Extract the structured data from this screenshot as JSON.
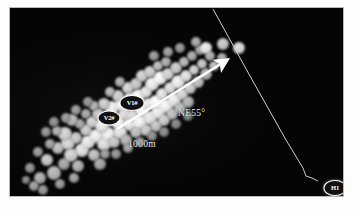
{
  "figure": {
    "type": "map-scatter",
    "background_color": "#070707",
    "frame_color": "#b9b9b9",
    "panel": {
      "x": 9,
      "y": 7,
      "width": 335,
      "height": 190
    }
  },
  "annotations": {
    "bearing_label": "NE55°",
    "scale_label": "1000m"
  },
  "markers": [
    {
      "id": "v1",
      "label": "V1#",
      "x": 122,
      "y": 95
    },
    {
      "id": "v2",
      "label": "V2#",
      "x": 99,
      "y": 110
    },
    {
      "id": "h1",
      "label": "H1",
      "x": 325,
      "y": 180
    }
  ],
  "arrow": {
    "name": "bearing-arrow",
    "color": "#ffffff",
    "x1": 117,
    "y1": 129,
    "x2": 227,
    "y2": 60
  },
  "trace_line": {
    "name": "fault-trace-line",
    "color": "#cfcfcf",
    "points": "213,9 250,76 286,140 303,168 306,176 312,178 318,181"
  },
  "chart_data": {
    "type": "scatter",
    "title": "",
    "xlabel": "",
    "ylabel": "",
    "xlim": [
      0,
      335
    ],
    "ylim": [
      0,
      190
    ],
    "grid": false,
    "legend": "none",
    "series": [
      {
        "name": "event-cluster",
        "color_range": [
          "#4a4a4a",
          "#e8e8e8"
        ],
        "points": [
          [
            44,
            165,
            7,
            0.62
          ],
          [
            37,
            152,
            6,
            0.7
          ],
          [
            54,
            156,
            6,
            0.55
          ],
          [
            30,
            170,
            6,
            0.58
          ],
          [
            61,
            147,
            7,
            0.74
          ],
          [
            48,
            140,
            6,
            0.66
          ],
          [
            40,
            136,
            5,
            0.52
          ],
          [
            58,
            135,
            7,
            0.78
          ],
          [
            68,
            158,
            6,
            0.6
          ],
          [
            72,
            142,
            7,
            0.82
          ],
          [
            66,
            130,
            6,
            0.7
          ],
          [
            55,
            126,
            7,
            0.76
          ],
          [
            47,
            123,
            5,
            0.58
          ],
          [
            78,
            134,
            7,
            0.85
          ],
          [
            84,
            147,
            6,
            0.66
          ],
          [
            90,
            156,
            6,
            0.54
          ],
          [
            76,
            122,
            6,
            0.72
          ],
          [
            86,
            128,
            7,
            0.88
          ],
          [
            94,
            136,
            7,
            0.8
          ],
          [
            82,
            114,
            6,
            0.74
          ],
          [
            70,
            116,
            5,
            0.56
          ],
          [
            62,
            112,
            6,
            0.64
          ],
          [
            98,
            126,
            7,
            0.9
          ],
          [
            104,
            134,
            6,
            0.7
          ],
          [
            92,
            118,
            7,
            0.86
          ],
          [
            100,
            112,
            6,
            0.78
          ],
          [
            88,
            106,
            6,
            0.68
          ],
          [
            76,
            106,
            5,
            0.55
          ],
          [
            110,
            124,
            7,
            0.84
          ],
          [
            116,
            132,
            6,
            0.62
          ],
          [
            108,
            114,
            7,
            0.92
          ],
          [
            114,
            106,
            6,
            0.8
          ],
          [
            102,
            100,
            7,
            0.88
          ],
          [
            94,
            96,
            6,
            0.72
          ],
          [
            84,
            98,
            5,
            0.6
          ],
          [
            120,
            116,
            7,
            0.86
          ],
          [
            126,
            124,
            6,
            0.66
          ],
          [
            122,
            108,
            6,
            0.78
          ],
          [
            130,
            114,
            7,
            0.9
          ],
          [
            136,
            122,
            6,
            0.7
          ],
          [
            112,
            96,
            7,
            0.94
          ],
          [
            120,
            90,
            6,
            0.82
          ],
          [
            108,
            88,
            6,
            0.74
          ],
          [
            100,
            84,
            5,
            0.62
          ],
          [
            132,
            102,
            7,
            0.92
          ],
          [
            140,
            110,
            7,
            0.84
          ],
          [
            146,
            118,
            6,
            0.68
          ],
          [
            138,
            96,
            6,
            0.86
          ],
          [
            128,
            88,
            7,
            0.9
          ],
          [
            118,
            80,
            6,
            0.76
          ],
          [
            110,
            74,
            5,
            0.58
          ],
          [
            148,
            104,
            7,
            0.88
          ],
          [
            154,
            112,
            6,
            0.72
          ],
          [
            146,
            94,
            7,
            0.94
          ],
          [
            136,
            84,
            6,
            0.82
          ],
          [
            126,
            76,
            6,
            0.7
          ],
          [
            156,
            98,
            7,
            0.9
          ],
          [
            162,
            106,
            6,
            0.66
          ],
          [
            152,
            86,
            6,
            0.84
          ],
          [
            142,
            76,
            7,
            0.88
          ],
          [
            132,
            68,
            6,
            0.74
          ],
          [
            164,
            92,
            7,
            0.86
          ],
          [
            170,
            100,
            6,
            0.64
          ],
          [
            160,
            80,
            6,
            0.8
          ],
          [
            150,
            70,
            7,
            0.92
          ],
          [
            140,
            64,
            6,
            0.72
          ],
          [
            172,
            86,
            6,
            0.78
          ],
          [
            178,
            94,
            6,
            0.6
          ],
          [
            168,
            74,
            7,
            0.88
          ],
          [
            158,
            66,
            6,
            0.76
          ],
          [
            148,
            58,
            5,
            0.64
          ],
          [
            180,
            80,
            6,
            0.72
          ],
          [
            176,
            68,
            6,
            0.82
          ],
          [
            166,
            60,
            6,
            0.7
          ],
          [
            156,
            54,
            5,
            0.58
          ],
          [
            188,
            74,
            6,
            0.66
          ],
          [
            184,
            62,
            5,
            0.74
          ],
          [
            174,
            54,
            5,
            0.62
          ],
          [
            196,
            66,
            6,
            0.6
          ],
          [
            192,
            56,
            5,
            0.68
          ],
          [
            182,
            48,
            5,
            0.56
          ],
          [
            204,
            58,
            5,
            0.64
          ],
          [
            200,
            48,
            5,
            0.58
          ],
          [
            190,
            42,
            5,
            0.52
          ],
          [
            212,
            50,
            5,
            0.55
          ],
          [
            24,
            178,
            5,
            0.5
          ],
          [
            33,
            182,
            5,
            0.46
          ],
          [
            50,
            176,
            5,
            0.48
          ],
          [
            64,
            170,
            5,
            0.52
          ],
          [
            20,
            160,
            5,
            0.44
          ],
          [
            28,
            144,
            5,
            0.48
          ],
          [
            16,
            172,
            4,
            0.4
          ],
          [
            95,
            146,
            5,
            0.5
          ],
          [
            106,
            146,
            5,
            0.46
          ],
          [
            118,
            140,
            5,
            0.52
          ],
          [
            130,
            134,
            5,
            0.48
          ],
          [
            142,
            128,
            5,
            0.44
          ],
          [
            154,
            124,
            5,
            0.42
          ],
          [
            166,
            116,
            5,
            0.4
          ],
          [
            178,
            108,
            5,
            0.38
          ],
          [
            196,
            40,
            6,
            0.85
          ],
          [
            213,
            36,
            6,
            0.7
          ],
          [
            229,
            40,
            6,
            0.78
          ],
          [
            186,
            34,
            5,
            0.55
          ],
          [
            158,
            44,
            5,
            0.5
          ],
          [
            170,
            40,
            5,
            0.46
          ],
          [
            144,
            48,
            5,
            0.48
          ],
          [
            56,
            110,
            5,
            0.48
          ],
          [
            44,
            114,
            5,
            0.44
          ],
          [
            36,
            124,
            5,
            0.46
          ],
          [
            66,
            102,
            5,
            0.5
          ],
          [
            78,
            94,
            5,
            0.46
          ]
        ]
      }
    ]
  }
}
